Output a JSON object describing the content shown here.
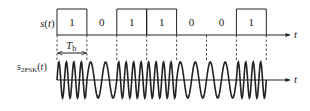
{
  "diagram": {
    "signal_label": "s(t)",
    "signal_label_main": "s",
    "signal_label_arg": "(t)",
    "fsk_label_main": "s",
    "fsk_label_sub": "2FSK",
    "fsk_label_arg": "(t)",
    "time_axis_label": "t",
    "period_label_main": "T",
    "period_label_sub": "b",
    "bits": [
      1,
      0,
      1,
      1,
      0,
      0,
      1
    ],
    "bit_labels": [
      "1",
      "0",
      "1",
      "1",
      "0",
      "0",
      "1"
    ],
    "cycles_per_bit": {
      "1": 4,
      "0": 2
    },
    "colors": {
      "stroke": "#222222",
      "background": "#ffffff"
    }
  }
}
